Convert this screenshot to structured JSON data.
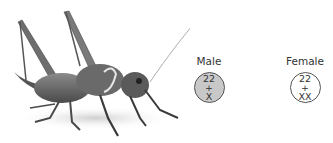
{
  "illustration": {
    "subject": "cricket",
    "style": "grayscale photo"
  },
  "karyotypes": [
    {
      "label": "Male",
      "autosomes": "22",
      "plus": "+",
      "sex_chromosomes": "X",
      "fill": "#c8c8c8"
    },
    {
      "label": "Female",
      "autosomes": "22",
      "plus": "+",
      "sex_chromosomes": "XX",
      "fill": "#ffffff"
    }
  ]
}
